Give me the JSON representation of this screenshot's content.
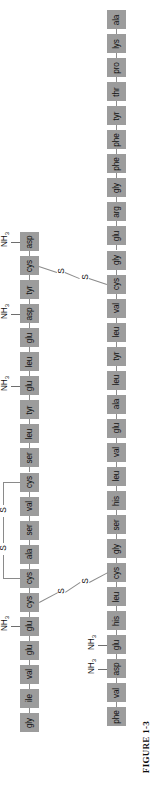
{
  "figure": {
    "caption_prefix": "FIGURE",
    "caption_number": "1-3",
    "caption_full": "FIGURE 1-3",
    "orientation": "rotated-90-counterclockwise",
    "molecule": "insulin",
    "background_color": "#ffffff",
    "residue_box_color": "#9c9c9c",
    "bond_line_color": "#8a8a8a",
    "text_color": "#101010"
  },
  "chains": [
    {
      "id": "chain-a",
      "name": "A chain",
      "column": "left",
      "residue_count": 21,
      "residues": [
        "asp",
        "cys",
        "tyr",
        "asp",
        "glu",
        "leu",
        "glu",
        "tyr",
        "leu",
        "ser",
        "cys",
        "val",
        "ser",
        "ala",
        "cys",
        "cys",
        "glu",
        "glu",
        "val",
        "ile",
        "gly"
      ]
    },
    {
      "id": "chain-b",
      "name": "B chain",
      "column": "right",
      "residue_count": 30,
      "residues": [
        "ala",
        "lys",
        "pro",
        "thr",
        "tyr",
        "phe",
        "phe",
        "gly",
        "arg",
        "glu",
        "gly",
        "cys",
        "val",
        "leu",
        "tyr",
        "leu",
        "ala",
        "glu",
        "val",
        "leu",
        "his",
        "ser",
        "gly",
        "cys",
        "leu",
        "his",
        "glu",
        "asp",
        "val",
        "phe"
      ]
    }
  ],
  "amine_groups": [
    {
      "label": "NH",
      "subscript": "3",
      "attached_to_chain": "chain-a",
      "attached_to_index": 0,
      "attached_to_residue": "asp"
    },
    {
      "label": "NH",
      "subscript": "3",
      "attached_to_chain": "chain-a",
      "attached_to_index": 3,
      "attached_to_residue": "asp"
    },
    {
      "label": "NH",
      "subscript": "3",
      "attached_to_chain": "chain-a",
      "attached_to_index": 6,
      "attached_to_residue": "glu"
    },
    {
      "label": "NH",
      "subscript": "3",
      "attached_to_chain": "chain-a",
      "attached_to_index": 16,
      "attached_to_residue": "glu"
    },
    {
      "label": "NH",
      "subscript": "3",
      "attached_to_chain": "chain-b",
      "attached_to_index": 26,
      "attached_to_residue": "glu"
    },
    {
      "label": "NH",
      "subscript": "3",
      "attached_to_chain": "chain-b",
      "attached_to_index": 27,
      "attached_to_residue": "asp"
    }
  ],
  "disulfide_bonds": [
    {
      "id": "ss-interchain-1",
      "type": "interchain",
      "sulfur_label": "S",
      "from_chain": "chain-a",
      "from_index": 1,
      "from_residue": "cys",
      "to_chain": "chain-b",
      "to_index": 11,
      "to_residue": "cys"
    },
    {
      "id": "ss-interchain-2",
      "type": "interchain",
      "sulfur_label": "S",
      "from_chain": "chain-a",
      "from_index": 15,
      "from_residue": "cys",
      "to_chain": "chain-b",
      "to_index": 23,
      "to_residue": "cys"
    },
    {
      "id": "ss-intrachain-1",
      "type": "intrachain",
      "sulfur_label": "S",
      "from_chain": "chain-a",
      "from_index": 10,
      "from_residue": "cys",
      "to_chain": "chain-a",
      "to_index": 14,
      "to_residue": "cys"
    }
  ]
}
